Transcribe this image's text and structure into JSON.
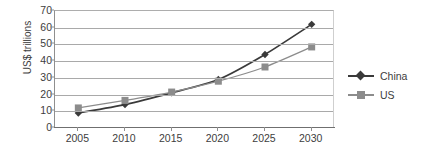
{
  "chart_data": {
    "type": "line",
    "title": "",
    "subtitle": "",
    "xlabel": "",
    "ylabel": "US$ trillions",
    "categories": [
      "2005",
      "2010",
      "2015",
      "2020",
      "2025",
      "2030"
    ],
    "x": [
      2005,
      2010,
      2015,
      2020,
      2025,
      2030
    ],
    "series": [
      {
        "name": "China",
        "values": [
          9,
          14,
          21,
          29,
          44,
          62
        ],
        "color": "#3a3a3a",
        "marker": "diamond"
      },
      {
        "name": "US",
        "values": [
          12,
          16.5,
          21.5,
          28,
          36.5,
          48.5
        ],
        "color": "#8c8c8c",
        "marker": "square"
      }
    ],
    "ylim": [
      0,
      70
    ],
    "y_ticks": [
      0,
      10,
      20,
      30,
      40,
      50,
      60,
      70
    ],
    "y_tick_labels": [
      "0",
      "10",
      "20",
      "30",
      "40",
      "50",
      "60",
      "70"
    ],
    "grid": true,
    "grid_axis": "y",
    "legend_position": "right",
    "legend_entries": [
      "China",
      "US"
    ]
  },
  "colors": {
    "china": "#3a3a3a",
    "us": "#8c8c8c",
    "gridline": "#a9a9a9",
    "axis": "#6f6f6f",
    "text": "#3d3d3d",
    "background": "#ffffff"
  }
}
